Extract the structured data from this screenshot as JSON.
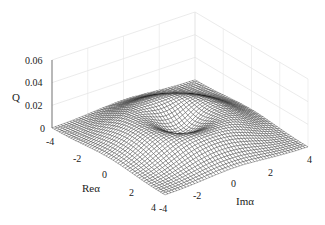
{
  "chart_data": {
    "type": "surface",
    "title": "",
    "zlabel": "Q",
    "xlabel": "Reα",
    "ylabel": "Imα",
    "x_range": [
      -4,
      4
    ],
    "y_range": [
      -4,
      4
    ],
    "z_range": [
      0,
      0.06
    ],
    "x_ticks": [
      "-4",
      "-2",
      "0",
      "2",
      "4"
    ],
    "y_ticks": [
      "-4",
      "-2",
      "0",
      "2",
      "4"
    ],
    "z_ticks": [
      "0",
      "0.02",
      "0.04",
      "0.06"
    ],
    "grid": true
  },
  "axes": {
    "zlabel": "Q",
    "xlabel": "Reα",
    "ylabel": "Imα",
    "z_ticks": [
      "0",
      "0.02",
      "0.04",
      "0.06"
    ],
    "x_ticks": [
      "-4",
      "-2",
      "0",
      "2",
      "4"
    ],
    "y_ticks": [
      "-4",
      "-2",
      "0",
      "2",
      "4"
    ]
  }
}
